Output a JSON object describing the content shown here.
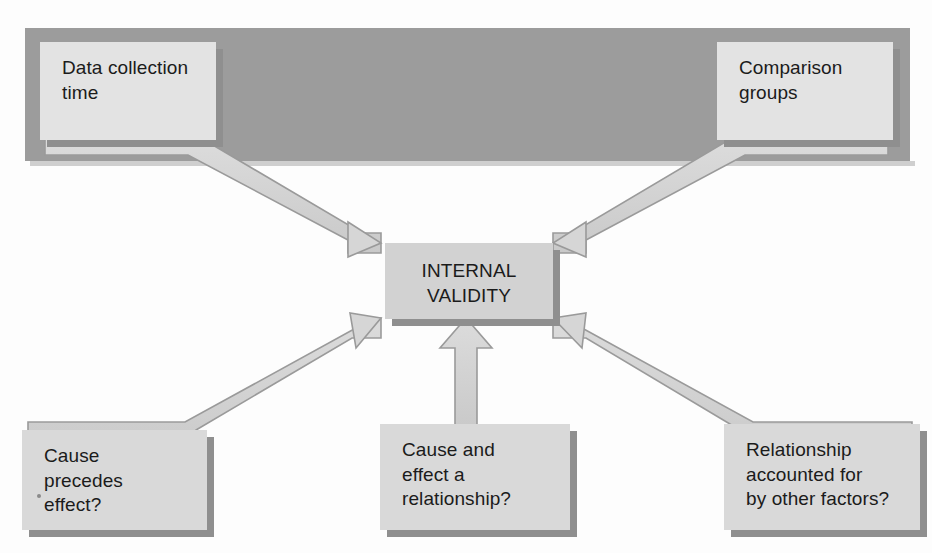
{
  "figure": {
    "title": "INTERNAL VALIDITY",
    "scan_artifact_text": "      "
  },
  "nodes": {
    "data_collection": {
      "label": "Data collection time",
      "line1": "Data collection",
      "line2": "time"
    },
    "comparison_groups": {
      "label": "Comparison groups",
      "line1": "Comparison",
      "line2": "groups"
    },
    "internal_validity": {
      "line1": "INTERNAL",
      "line2": "VALIDITY"
    },
    "cause_precedes": {
      "label": "Cause precedes effect?",
      "line1": "Cause",
      "line2": "precedes",
      "line3": "effect?"
    },
    "cause_effect": {
      "label": "Cause and effect a relationship?",
      "line1": "Cause and",
      "line2": "effect a",
      "line3": "relationship?"
    },
    "relationship_factors": {
      "label": "Relationship accounted for by other factors?",
      "line1": "Relationship",
      "line2": "accounted for",
      "line3": "by other factors?"
    }
  },
  "arrows": [
    {
      "name": "arrow-data-collection-to-center",
      "from": "data_collection",
      "to": "internal_validity",
      "direction": "down-right"
    },
    {
      "name": "arrow-comparison-groups-to-center",
      "from": "comparison_groups",
      "to": "internal_validity",
      "direction": "down-left"
    },
    {
      "name": "arrow-cause-precedes-to-center",
      "from": "cause_precedes",
      "to": "internal_validity",
      "direction": "up-right"
    },
    {
      "name": "arrow-cause-effect-to-center",
      "from": "cause_effect",
      "to": "internal_validity",
      "direction": "up"
    },
    {
      "name": "arrow-relationship-to-center",
      "from": "relationship_factors",
      "to": "internal_validity",
      "direction": "up-left"
    }
  ],
  "colors": {
    "band": "#9c9c9c",
    "box_fill": "#d9d9d9",
    "center_box_fill": "#d2d2d2",
    "arrow_fill": "#d2d2d2",
    "arrow_edge": "#8f8f8f",
    "text": "#1b1b1b",
    "background": "#fdfdfd"
  }
}
